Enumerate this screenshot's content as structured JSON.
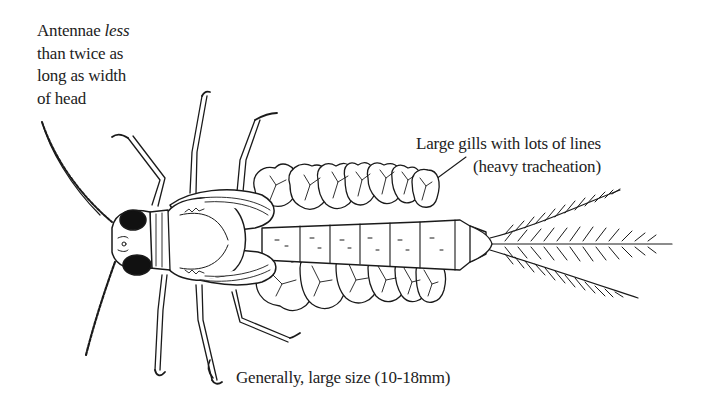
{
  "diagram": {
    "labels": {
      "antennae": {
        "line1_pre": "Antennae ",
        "line1_em": "less",
        "line2": "than twice as",
        "line3": "long as width",
        "line4": "of head"
      },
      "gills": {
        "line1": "Large gills with lots of lines",
        "line2": "(heavy tracheation)"
      },
      "size": {
        "text": "Generally, large size (10-18mm)"
      }
    },
    "colors": {
      "ink": "#1a1a1a",
      "text": "#222222",
      "background": "#ffffff"
    }
  }
}
